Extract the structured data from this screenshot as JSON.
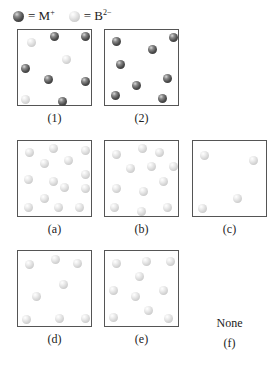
{
  "legend": [
    {
      "type": "dark",
      "label": "= M",
      "charge": "+"
    },
    {
      "type": "light",
      "label": "= B",
      "charge": "2−"
    }
  ],
  "boxes": [
    {
      "id": "1",
      "label": "(1)",
      "left": 17,
      "top": 29,
      "balls": [
        {
          "t": "light",
          "x": 13.7,
          "y": 12.7
        },
        {
          "t": "dark",
          "x": 36.3,
          "y": 6.3
        },
        {
          "t": "dark",
          "x": 67,
          "y": 6.3
        },
        {
          "t": "light",
          "x": 48.7,
          "y": 29
        },
        {
          "t": "dark",
          "x": 7.3,
          "y": 38
        },
        {
          "t": "dark",
          "x": 30.3,
          "y": 49.3
        },
        {
          "t": "dark",
          "x": 67,
          "y": 51
        },
        {
          "t": "light",
          "x": 7.3,
          "y": 69
        },
        {
          "t": "dark",
          "x": 44.7,
          "y": 71
        }
      ]
    },
    {
      "id": "2",
      "label": "(2)",
      "left": 104,
      "top": 29,
      "balls": [
        {
          "t": "dark",
          "x": 11.3,
          "y": 11.3
        },
        {
          "t": "dark",
          "x": 68,
          "y": 7
        },
        {
          "t": "dark",
          "x": 47.3,
          "y": 19.7
        },
        {
          "t": "dark",
          "x": 15.3,
          "y": 34.3
        },
        {
          "t": "dark",
          "x": 62.3,
          "y": 48
        },
        {
          "t": "dark",
          "x": 31.7,
          "y": 55.3
        },
        {
          "t": "dark",
          "x": 10,
          "y": 65.3
        },
        {
          "t": "dark",
          "x": 57,
          "y": 68
        }
      ]
    },
    {
      "id": "a",
      "label": "(a)",
      "left": 17,
      "top": 140,
      "balls": [
        {
          "t": "light",
          "x": 11.3,
          "y": 11
        },
        {
          "t": "light",
          "x": 35.7,
          "y": 7
        },
        {
          "t": "light",
          "x": 67.3,
          "y": 9.7
        },
        {
          "t": "light",
          "x": 26.7,
          "y": 22.3
        },
        {
          "t": "light",
          "x": 50.7,
          "y": 19
        },
        {
          "t": "light",
          "x": 67.3,
          "y": 33
        },
        {
          "t": "light",
          "x": 10.7,
          "y": 38.3
        },
        {
          "t": "light",
          "x": 35,
          "y": 40.3
        },
        {
          "t": "light",
          "x": 46.7,
          "y": 46.3
        },
        {
          "t": "light",
          "x": 67.3,
          "y": 47.3
        },
        {
          "t": "light",
          "x": 26.7,
          "y": 57.7
        },
        {
          "t": "light",
          "x": 10,
          "y": 66
        },
        {
          "t": "light",
          "x": 40.7,
          "y": 66.3
        },
        {
          "t": "light",
          "x": 61.3,
          "y": 66.3
        }
      ]
    },
    {
      "id": "b",
      "label": "(b)",
      "left": 104,
      "top": 140,
      "balls": [
        {
          "t": "light",
          "x": 11.3,
          "y": 13
        },
        {
          "t": "light",
          "x": 37.7,
          "y": 7.3
        },
        {
          "t": "light",
          "x": 54.7,
          "y": 11.3
        },
        {
          "t": "light",
          "x": 25,
          "y": 27.7
        },
        {
          "t": "light",
          "x": 46.7,
          "y": 25.7
        },
        {
          "t": "light",
          "x": 68.7,
          "y": 25.7
        },
        {
          "t": "light",
          "x": 58.7,
          "y": 40.3
        },
        {
          "t": "light",
          "x": 11.7,
          "y": 47.7
        },
        {
          "t": "light",
          "x": 38.3,
          "y": 50.3
        },
        {
          "t": "light",
          "x": 9.7,
          "y": 66
        },
        {
          "t": "light",
          "x": 36,
          "y": 70.3
        },
        {
          "t": "light",
          "x": 62.3,
          "y": 66
        }
      ]
    },
    {
      "id": "c",
      "label": "(c)",
      "left": 192,
      "top": 140,
      "balls": [
        {
          "t": "light",
          "x": 11.3,
          "y": 14.3
        },
        {
          "t": "light",
          "x": 60.7,
          "y": 19
        },
        {
          "t": "light",
          "x": 44.7,
          "y": 57.3
        },
        {
          "t": "light",
          "x": 9.3,
          "y": 67
        }
      ]
    },
    {
      "id": "d",
      "label": "(d)",
      "left": 17,
      "top": 250,
      "balls": [
        {
          "t": "light",
          "x": 11.3,
          "y": 13
        },
        {
          "t": "light",
          "x": 37.7,
          "y": 8.7
        },
        {
          "t": "light",
          "x": 59.7,
          "y": 12.3
        },
        {
          "t": "light",
          "x": 45,
          "y": 33.7
        },
        {
          "t": "light",
          "x": 18.7,
          "y": 45.7
        },
        {
          "t": "light",
          "x": 8,
          "y": 68.3
        },
        {
          "t": "light",
          "x": 41.7,
          "y": 67.3
        },
        {
          "t": "light",
          "x": 67,
          "y": 67.3
        }
      ]
    },
    {
      "id": "e",
      "label": "(e)",
      "left": 104,
      "top": 250,
      "balls": [
        {
          "t": "light",
          "x": 11.3,
          "y": 12.3
        },
        {
          "t": "light",
          "x": 41.7,
          "y": 10.7
        },
        {
          "t": "light",
          "x": 65.7,
          "y": 10.7
        },
        {
          "t": "light",
          "x": 34,
          "y": 25.7
        },
        {
          "t": "light",
          "x": 8.3,
          "y": 39
        },
        {
          "t": "light",
          "x": 58.3,
          "y": 39
        },
        {
          "t": "light",
          "x": 30,
          "y": 45.7
        },
        {
          "t": "light",
          "x": 43.3,
          "y": 59
        },
        {
          "t": "light",
          "x": 8.3,
          "y": 66
        },
        {
          "t": "light",
          "x": 63,
          "y": 67.7
        }
      ]
    }
  ],
  "option_f": {
    "text": "None",
    "label": "(f)"
  }
}
